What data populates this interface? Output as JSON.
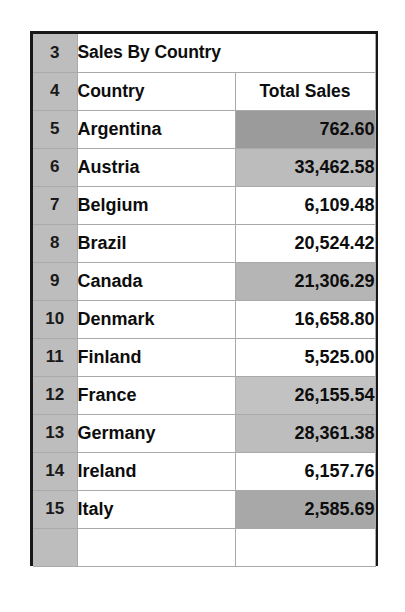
{
  "app": {
    "kind": "spreadsheet-range-capture"
  },
  "sheet": {
    "title": "Sales By Country",
    "columns": {
      "country": "Country",
      "total_sales": "Total Sales"
    },
    "row_numbers": {
      "title": "3",
      "header": "4"
    },
    "colors": {
      "gutter_fill": "#bdbdbd",
      "grid_line": "#aaaaaa",
      "frame": "#181818",
      "cell_fill_none": "#ffffff",
      "cell_fill_light": "#c6c6c6",
      "cell_fill_medium": "#b3b3b3",
      "cell_fill_dark": "#9b9b9b"
    },
    "rows": [
      {
        "row": "5",
        "country": "Argentina",
        "total_sales": "762.60",
        "fill": "#9b9b9b"
      },
      {
        "row": "6",
        "country": "Austria",
        "total_sales": "33,462.58",
        "fill": "#bcbcbc"
      },
      {
        "row": "7",
        "country": "Belgium",
        "total_sales": "6,109.48",
        "fill": "#ffffff"
      },
      {
        "row": "8",
        "country": "Brazil",
        "total_sales": "20,524.42",
        "fill": "#ffffff"
      },
      {
        "row": "9",
        "country": "Canada",
        "total_sales": "21,306.29",
        "fill": "#b5b5b5"
      },
      {
        "row": "10",
        "country": "Denmark",
        "total_sales": "16,658.80",
        "fill": "#ffffff"
      },
      {
        "row": "11",
        "country": "Finland",
        "total_sales": "5,525.00",
        "fill": "#ffffff"
      },
      {
        "row": "12",
        "country": "France",
        "total_sales": "26,155.54",
        "fill": "#c2c2c2"
      },
      {
        "row": "13",
        "country": "Germany",
        "total_sales": "28,361.38",
        "fill": "#bdbdbd"
      },
      {
        "row": "14",
        "country": "Ireland",
        "total_sales": "6,157.76",
        "fill": "#ffffff"
      },
      {
        "row": "15",
        "country": "Italy",
        "total_sales": "2,585.69",
        "fill": "#a8a8a8"
      }
    ]
  },
  "chart_data": {
    "type": "table",
    "title": "Sales By Country",
    "columns": [
      "Country",
      "Total Sales"
    ],
    "categories": [
      "Argentina",
      "Austria",
      "Belgium",
      "Brazil",
      "Canada",
      "Denmark",
      "Finland",
      "France",
      "Germany",
      "Ireland",
      "Italy"
    ],
    "values": [
      762.6,
      33462.58,
      6109.48,
      20524.42,
      21306.29,
      16658.8,
      5525.0,
      26155.54,
      28361.38,
      6157.76,
      2585.69
    ],
    "xlabel": "Country",
    "ylabel": "Total Sales",
    "grid": true,
    "legend": "none"
  }
}
